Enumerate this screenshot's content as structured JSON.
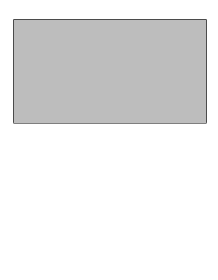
{
  "diagram": {
    "colors": {
      "fabric": "#bdbdbd",
      "neckline_opening": "#ffffff",
      "ink": "#1a1a1a",
      "border": "#2a2a2a"
    },
    "labels": {
      "staystitch": "STAYSTITCH",
      "mark_top": "MARK",
      "quarter_inch": "¼\"(6mm)",
      "five_inch": "5\"(12.5cm)",
      "mark_bottom": "MARK",
      "center": "CENTER",
      "back": "BACK"
    }
  }
}
